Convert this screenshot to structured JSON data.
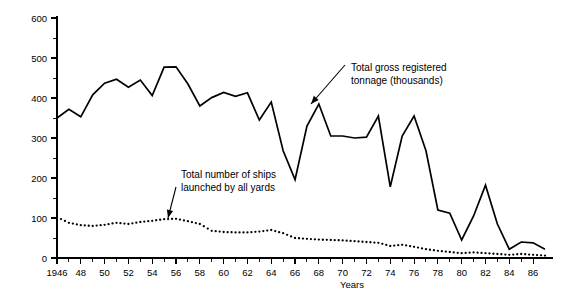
{
  "chart_data": {
    "type": "line",
    "title": "",
    "xlabel": "Years",
    "ylabel": "",
    "xlim": [
      1946,
      1987
    ],
    "ylim": [
      0,
      600
    ],
    "grid": false,
    "legend_position": "none",
    "y_ticks": [
      0,
      100,
      200,
      300,
      400,
      500,
      600
    ],
    "y_tick_labels": [
      "0",
      "100",
      "200",
      "300",
      "400",
      "500",
      "600"
    ],
    "y_minor_ticks": [
      50,
      150,
      250,
      350,
      450,
      550
    ],
    "x_ticks": [
      1946,
      1948,
      1950,
      1952,
      1954,
      1956,
      1958,
      1960,
      1962,
      1964,
      1966,
      1968,
      1970,
      1972,
      1974,
      1976,
      1978,
      1980,
      1982,
      1984,
      1986
    ],
    "x_tick_labels": [
      "1946",
      "48",
      "50",
      "52",
      "54",
      "56",
      "58",
      "60",
      "62",
      "64",
      "66",
      "68",
      "70",
      "72",
      "74",
      "76",
      "78",
      "80",
      "82",
      "84",
      "86"
    ],
    "x": [
      1946,
      1947,
      1948,
      1949,
      1950,
      1951,
      1952,
      1953,
      1954,
      1955,
      1956,
      1957,
      1958,
      1959,
      1960,
      1961,
      1962,
      1963,
      1964,
      1965,
      1966,
      1967,
      1968,
      1969,
      1970,
      1971,
      1972,
      1973,
      1974,
      1975,
      1976,
      1977,
      1978,
      1979,
      1980,
      1981,
      1982,
      1983,
      1984,
      1985,
      1986,
      1987
    ],
    "series": [
      {
        "name": "Total gross registered tonnage (thousands)",
        "style": "solid-line",
        "values": [
          350,
          372,
          353,
          408,
          437,
          447,
          427,
          445,
          406,
          477,
          478,
          435,
          380,
          401,
          414,
          404,
          413,
          345,
          390,
          268,
          196,
          330,
          385,
          305,
          305,
          300,
          302,
          355,
          178,
          305,
          355,
          268,
          120,
          112,
          45,
          105,
          182,
          85,
          22,
          40,
          38,
          22
        ]
      },
      {
        "name": "Total number of ships launched by all yards",
        "style": "dotted",
        "values": [
          102,
          88,
          82,
          80,
          83,
          88,
          85,
          90,
          93,
          97,
          98,
          92,
          85,
          68,
          65,
          64,
          64,
          66,
          70,
          62,
          50,
          48,
          46,
          45,
          44,
          42,
          40,
          38,
          30,
          33,
          28,
          22,
          18,
          15,
          12,
          14,
          12,
          10,
          8,
          10,
          8,
          6
        ]
      }
    ],
    "annotations": [
      {
        "id": "annotation-tonnage",
        "text_lines": [
          "Total gross registered",
          "tonnage (thousands)"
        ],
        "points_to_year": 1968
      },
      {
        "id": "annotation-ships",
        "text_lines": [
          "Total number of ships",
          "launched by all yards"
        ],
        "points_to_year": 1956
      }
    ]
  },
  "axis": {
    "x_title": "Years"
  }
}
